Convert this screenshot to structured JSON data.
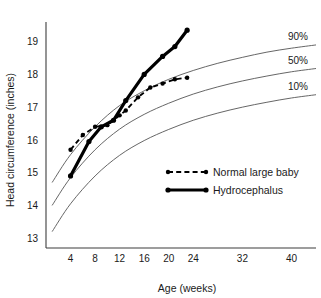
{
  "chart_data": {
    "type": "line",
    "title": "",
    "xlabel": "Age (weeks)",
    "ylabel": "Head circumference (inches)",
    "xlim": [
      0,
      44
    ],
    "ylim": [
      12.7,
      19.6
    ],
    "xticks": [
      4,
      8,
      12,
      16,
      20,
      24,
      32,
      40
    ],
    "yticks": [
      13,
      14,
      15,
      16,
      17,
      18,
      19
    ],
    "grid": false,
    "legend_position": "center-right",
    "annotations": [
      "90%",
      "50%",
      "10%"
    ],
    "reference_curves": [
      {
        "name": "90%",
        "label": "90%",
        "x": [
          1,
          4,
          8,
          12,
          16,
          20,
          24,
          28,
          32,
          36,
          40,
          44
        ],
        "y": [
          14.7,
          15.55,
          16.4,
          17.05,
          17.5,
          17.85,
          18.12,
          18.34,
          18.52,
          18.68,
          18.8,
          18.9
        ]
      },
      {
        "name": "50%",
        "label": "50%",
        "x": [
          1,
          4,
          8,
          12,
          16,
          20,
          24,
          28,
          32,
          36,
          40,
          44
        ],
        "y": [
          14.0,
          14.85,
          15.7,
          16.33,
          16.78,
          17.12,
          17.4,
          17.62,
          17.8,
          17.95,
          18.08,
          18.18
        ]
      },
      {
        "name": "10%",
        "label": "10%",
        "x": [
          1,
          4,
          8,
          12,
          16,
          20,
          24,
          28,
          32,
          36,
          40,
          44
        ],
        "y": [
          13.2,
          14.05,
          14.9,
          15.53,
          15.98,
          16.32,
          16.6,
          16.82,
          17.0,
          17.15,
          17.28,
          17.38
        ]
      }
    ],
    "series": [
      {
        "name": "Normal large baby",
        "style": "dashed",
        "x": [
          4,
          6,
          8,
          10,
          12,
          13,
          15,
          17,
          19,
          21,
          23
        ],
        "y": [
          15.7,
          16.15,
          16.4,
          16.45,
          16.75,
          16.9,
          17.3,
          17.6,
          17.72,
          17.85,
          17.9
        ]
      },
      {
        "name": "Hydrocephalus",
        "style": "solid",
        "x": [
          4,
          7,
          9,
          11,
          13,
          16,
          19,
          21,
          23
        ],
        "y": [
          14.9,
          15.95,
          16.4,
          16.6,
          17.2,
          18.0,
          18.55,
          18.85,
          19.35
        ]
      }
    ]
  },
  "legend": {
    "items": [
      {
        "label": "Normal large baby",
        "style": "dashed"
      },
      {
        "label": "Hydrocephalus",
        "style": "solid"
      }
    ]
  }
}
